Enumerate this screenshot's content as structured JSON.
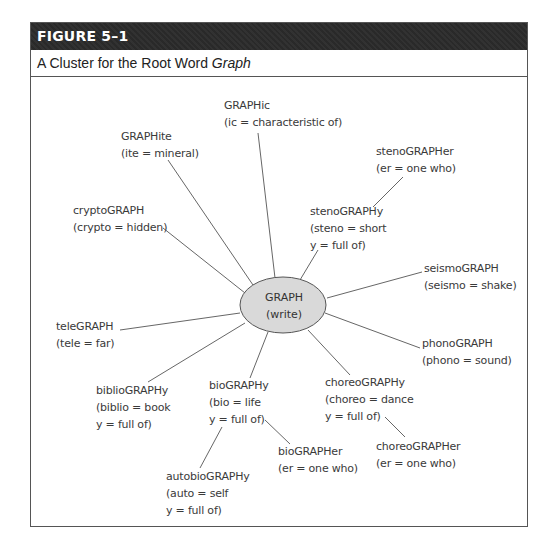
{
  "figure": {
    "number_label": "FIGURE 5–1",
    "caption_prefix": "A Cluster for the Root Word ",
    "caption_emphasis": "Graph"
  },
  "diagram": {
    "center": {
      "line1": "GRAPH",
      "line2": "(write)",
      "fill": "#d9d9d9"
    },
    "nodes": [
      {
        "id": "graphic",
        "lines": [
          "GRAPHic",
          "(ic = characteristic of)"
        ]
      },
      {
        "id": "graphite",
        "lines": [
          "GRAPHite",
          "(ite = mineral)"
        ]
      },
      {
        "id": "stenographer",
        "lines": [
          "stenoGRAPHer",
          "(er = one who)"
        ]
      },
      {
        "id": "cryptograph",
        "lines": [
          "cryptoGRAPH",
          "(crypto = hidden)"
        ]
      },
      {
        "id": "stenography",
        "lines": [
          "stenoGRAPHy",
          "(steno = short",
          "y = full of)"
        ]
      },
      {
        "id": "seismograph",
        "lines": [
          "seismoGRAPH",
          "(seismo = shake)"
        ]
      },
      {
        "id": "telegraph",
        "lines": [
          "teleGRAPH",
          "(tele = far)"
        ]
      },
      {
        "id": "phonograph",
        "lines": [
          "phonoGRAPH",
          "(phono = sound)"
        ]
      },
      {
        "id": "bibliography",
        "lines": [
          "biblioGRAPHy",
          "(biblio = book",
          "y = full of)"
        ]
      },
      {
        "id": "biography",
        "lines": [
          "bioGRAPHy",
          "(bio = life",
          "y = full of)"
        ]
      },
      {
        "id": "choreography",
        "lines": [
          "choreoGRAPHy",
          "(choreo = dance",
          "y = full of)"
        ]
      },
      {
        "id": "biographer",
        "lines": [
          "bioGRAPHer",
          "(er = one who)"
        ]
      },
      {
        "id": "choreographer",
        "lines": [
          "choreoGRAPHer",
          "(er = one who)"
        ]
      },
      {
        "id": "autobiography",
        "lines": [
          "autobioGRAPHy",
          "(auto = self",
          "y = full of)"
        ]
      }
    ]
  }
}
